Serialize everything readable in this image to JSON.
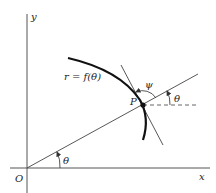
{
  "diagram": {
    "labels": {
      "y_axis": "y",
      "x_axis": "x",
      "origin": "O",
      "curve": "r = f(θ)",
      "point": "P",
      "psi": "ψ",
      "theta_at_p": "θ",
      "theta_at_origin": "θ"
    },
    "colors": {
      "line": "#333333",
      "curve": "#111111",
      "background": "#ffffff"
    }
  }
}
